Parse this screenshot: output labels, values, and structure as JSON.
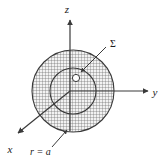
{
  "figure": {
    "background_color": "#ffffff",
    "line_color": "#3a3a3a",
    "hatch_color": "#5a5a5a",
    "fill_color": "#e8e8e8",
    "width": 166,
    "height": 162
  },
  "axes": [
    {
      "id": "z-axis",
      "label": "z",
      "direction": "up",
      "label_x": 67,
      "label_y": 13,
      "line": {
        "x1": 70,
        "y1": 131,
        "x2": 70,
        "y2": 19
      }
    },
    {
      "id": "y-axis",
      "label": "y",
      "direction": "right",
      "label_x": 155,
      "label_y": 96,
      "line": {
        "x1": 70,
        "y1": 91,
        "x2": 150,
        "y2": 91
      }
    },
    {
      "id": "x-axis",
      "label": "x",
      "direction": "lower-left",
      "label_x": 9,
      "label_y": 152,
      "line": {
        "x1": 70,
        "y1": 91,
        "x2": 17,
        "y2": 134
      }
    }
  ],
  "shapes": {
    "outer_sphere": {
      "name": "charged-sphere",
      "cx": 73,
      "cy": 91,
      "r": 41,
      "hatched": true,
      "label": "r = a"
    },
    "inner_sphere": {
      "name": "gaussian-surface-sphere",
      "cx": 73,
      "cy": 91,
      "r": 23,
      "hatched": true,
      "label": "Σ"
    },
    "surface_element": {
      "name": "surface-element-marker",
      "cx": 76,
      "cy": 78,
      "r": 3.5,
      "filled": false
    }
  },
  "annotations": [
    {
      "id": "sigma-annotation",
      "label": "Σ",
      "label_x": 110,
      "label_y": 46,
      "leader": {
        "x1": 106,
        "y1": 47,
        "x2": 80,
        "y2": 71
      }
    },
    {
      "id": "radius-annotation",
      "label": "r = a",
      "label_x": 40,
      "label_y": 154,
      "leader": {
        "x1": 53,
        "y1": 146,
        "x2": 67,
        "y2": 129
      }
    }
  ]
}
